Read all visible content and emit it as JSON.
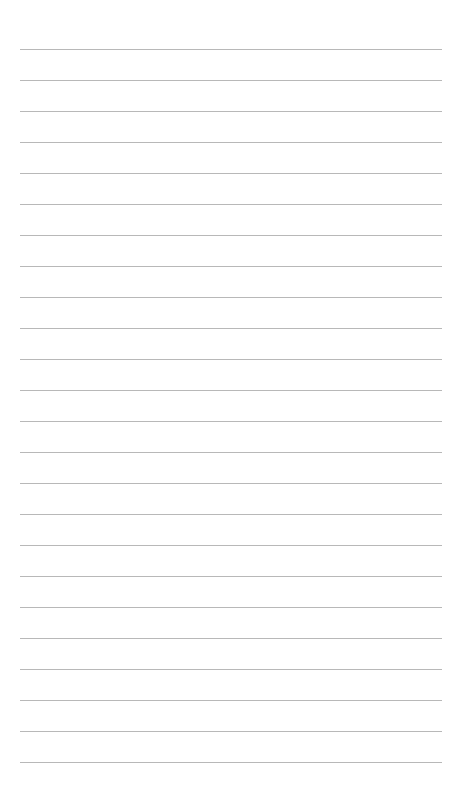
{
  "page": {
    "type": "lined-paper",
    "background_color": "#ffffff",
    "line_color": "#b8b8b8",
    "line_count": 24,
    "first_line_y": 49,
    "line_spacing": 31,
    "line_left": 20,
    "line_width": 422
  }
}
